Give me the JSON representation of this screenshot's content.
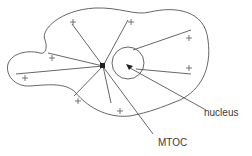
{
  "diagram": {
    "type": "cell-schematic",
    "labels": {
      "nucleus": "nucleus",
      "mtoc": "MTOC"
    },
    "colors": {
      "stroke": "#555555",
      "text": "#3a3a3a",
      "background": "#ffffff"
    },
    "mtoc": {
      "x": 103,
      "y": 66
    },
    "nucleus": {
      "cx": 128,
      "cy": 63,
      "r": 16
    },
    "plus_ends": [
      {
        "x": 73,
        "y": 22
      },
      {
        "x": 131,
        "y": 22
      },
      {
        "x": 52,
        "y": 58
      },
      {
        "x": 25,
        "y": 78
      },
      {
        "x": 189,
        "y": 38
      },
      {
        "x": 189,
        "y": 68
      },
      {
        "x": 78,
        "y": 101
      },
      {
        "x": 120,
        "y": 111
      }
    ],
    "marker_symbol": "+"
  }
}
